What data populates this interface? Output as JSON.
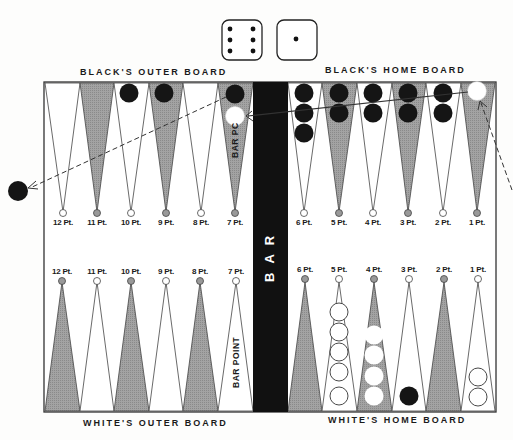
{
  "dice": [
    {
      "name": "die-six",
      "value": 6
    },
    {
      "name": "die-one",
      "value": 1
    }
  ],
  "labels": {
    "black_outer": "BLACK'S OUTER BOARD",
    "black_home": "BLACK'S HOME BOARD",
    "white_outer": "WHITE'S OUTER BOARD",
    "white_home": "WHITE'S HOME BOARD",
    "bar": "BAR",
    "bar_point_top": "BAR PC",
    "bar_point_bottom": "BAR POINT"
  },
  "top_points": [
    "12 Pt.",
    "11 Pt.",
    "10 Pt.",
    "9 Pt.",
    "8 Pt.",
    "7 Pt.",
    "6 Pt.",
    "5 Pt.",
    "4 Pt.",
    "3 Pt.",
    "2 Pt.",
    "1 Pt."
  ],
  "bottom_points": [
    "12 Pt.",
    "11 Pt.",
    "10 Pt.",
    "9 Pt.",
    "8 Pt.",
    "7 Pt.",
    "6 Pt.",
    "5 Pt.",
    "4 Pt.",
    "3 Pt.",
    "2 Pt.",
    "1 Pt."
  ],
  "colors": {
    "shaded_point": "#9a9a9a",
    "light_point": "#ffffff",
    "bar": "#111111",
    "black_checker": "#151515",
    "white_checker": "#ffffff",
    "outline": "#333333"
  },
  "checkers": {
    "top": {
      "10": {
        "black": 1
      },
      "9": {
        "black": 1
      },
      "7": {
        "black": 1,
        "white": 1
      },
      "6": {
        "black": 3
      },
      "5": {
        "black": 2
      },
      "4": {
        "black": 2
      },
      "3": {
        "black": 2
      },
      "2": {
        "black": 2
      },
      "1": {
        "white": 1
      }
    },
    "bottom": {
      "5": {
        "white_outline": 5
      },
      "4": {
        "white_solid": 4
      },
      "3": {
        "black": 1
      },
      "1": {
        "white_outline": 2
      }
    },
    "off_board": {
      "black": 1
    }
  }
}
